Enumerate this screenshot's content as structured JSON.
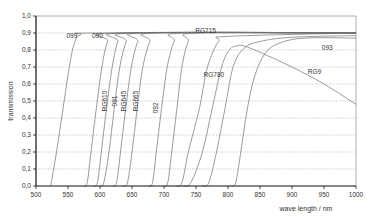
{
  "chart_data": {
    "type": "line",
    "title": "",
    "xlabel": "wave length / nm",
    "ylabel": "transmission",
    "xlim": [
      500,
      1000
    ],
    "ylim": [
      0.0,
      1.0
    ],
    "x_ticks": [
      "500",
      "550",
      "600",
      "650",
      "700",
      "750",
      "800",
      "850",
      "900",
      "950",
      "1000"
    ],
    "y_ticks": [
      "0,0",
      "0,1",
      "0,2",
      "0,3",
      "0,4",
      "0,5",
      "0,6",
      "0,7",
      "0,8",
      "0,9",
      "1,0"
    ],
    "grid": "horizontal dotted",
    "legend": "none (inline curve labels)",
    "series": [
      {
        "name": "099",
        "label_pos": [
          556,
          0.87
        ],
        "label_rot": 0,
        "points": [
          [
            523,
            0
          ],
          [
            532,
            0.2
          ],
          [
            542,
            0.45
          ],
          [
            552,
            0.7
          ],
          [
            560,
            0.84
          ],
          [
            570,
            0.89
          ],
          [
            600,
            0.9
          ],
          [
            1000,
            0.9
          ]
        ]
      },
      {
        "name": "090",
        "label_pos": [
          596,
          0.87
        ],
        "label_rot": 0,
        "points": [
          [
            575,
            0
          ],
          [
            580,
            0.02
          ],
          [
            586,
            0.2
          ],
          [
            594,
            0.45
          ],
          [
            603,
            0.7
          ],
          [
            612,
            0.85
          ],
          [
            625,
            0.9
          ],
          [
            1000,
            0.9
          ]
        ]
      },
      {
        "name": "RG610",
        "label_pos": [
          611,
          0.5
        ],
        "label_rot": -90,
        "points": [
          [
            590,
            0
          ],
          [
            596,
            0.02
          ],
          [
            602,
            0.2
          ],
          [
            610,
            0.45
          ],
          [
            619,
            0.7
          ],
          [
            628,
            0.85
          ],
          [
            640,
            0.9
          ],
          [
            1000,
            0.9
          ]
        ]
      },
      {
        "name": "091",
        "label_pos": [
          627,
          0.5
        ],
        "label_rot": -90,
        "points": [
          [
            600,
            0
          ],
          [
            606,
            0.02
          ],
          [
            614,
            0.2
          ],
          [
            622,
            0.45
          ],
          [
            631,
            0.7
          ],
          [
            641,
            0.85
          ],
          [
            653,
            0.9
          ],
          [
            1000,
            0.9
          ]
        ]
      },
      {
        "name": "RG645",
        "label_pos": [
          640,
          0.5
        ],
        "label_rot": -90,
        "points": [
          [
            620,
            0
          ],
          [
            626,
            0.02
          ],
          [
            632,
            0.2
          ],
          [
            640,
            0.45
          ],
          [
            649,
            0.7
          ],
          [
            659,
            0.85
          ],
          [
            670,
            0.9
          ],
          [
            1000,
            0.9
          ]
        ]
      },
      {
        "name": "RG665",
        "label_pos": [
          660,
          0.5
        ],
        "label_rot": -90,
        "points": [
          [
            636,
            0
          ],
          [
            643,
            0.02
          ],
          [
            650,
            0.2
          ],
          [
            658,
            0.45
          ],
          [
            667,
            0.7
          ],
          [
            678,
            0.85
          ],
          [
            690,
            0.9
          ],
          [
            1000,
            0.9
          ]
        ]
      },
      {
        "name": "092",
        "label_pos": [
          690,
          0.46
        ],
        "label_rot": -90,
        "points": [
          [
            676,
            0
          ],
          [
            682,
            0.02
          ],
          [
            688,
            0.2
          ],
          [
            696,
            0.45
          ],
          [
            705,
            0.7
          ],
          [
            716,
            0.85
          ],
          [
            730,
            0.9
          ],
          [
            1000,
            0.9
          ]
        ]
      },
      {
        "name": "RG715",
        "label_pos": [
          765,
          0.9
        ],
        "label_rot": 0,
        "points": [
          [
            700,
            0
          ],
          [
            706,
            0.02
          ],
          [
            712,
            0.2
          ],
          [
            720,
            0.45
          ],
          [
            728,
            0.7
          ],
          [
            738,
            0.85
          ],
          [
            752,
            0.9
          ],
          [
            1000,
            0.9
          ]
        ]
      },
      {
        "name": "RG780",
        "label_pos": [
          778,
          0.64
        ],
        "label_rot": 0,
        "points": [
          [
            718,
            0
          ],
          [
            728,
            0.02
          ],
          [
            738,
            0.2
          ],
          [
            755,
            0.45
          ],
          [
            768,
            0.7
          ],
          [
            785,
            0.85
          ],
          [
            800,
            0.88
          ],
          [
            1000,
            0.9
          ]
        ]
      },
      {
        "name": "RG9",
        "label_pos": [
          935,
          0.66
        ],
        "label_rot": 0,
        "points": [
          [
            730,
            0
          ],
          [
            742,
            0.02
          ],
          [
            760,
            0.2
          ],
          [
            775,
            0.45
          ],
          [
            790,
            0.7
          ],
          [
            802,
            0.8
          ],
          [
            815,
            0.825
          ],
          [
            828,
            0.82
          ],
          [
            860,
            0.77
          ],
          [
            900,
            0.7
          ],
          [
            950,
            0.6
          ],
          [
            1000,
            0.48
          ]
        ]
      },
      {
        "name": "093",
        "label_pos": [
          955,
          0.8
        ],
        "label_rot": 0,
        "points": [
          [
            805,
            0
          ],
          [
            812,
            0.02
          ],
          [
            820,
            0.2
          ],
          [
            830,
            0.45
          ],
          [
            842,
            0.65
          ],
          [
            858,
            0.78
          ],
          [
            880,
            0.84
          ],
          [
            920,
            0.87
          ],
          [
            1000,
            0.87
          ]
        ]
      },
      {
        "name": "RG830-upper",
        "label_pos": null,
        "label_rot": 0,
        "points": [
          [
            760,
            0
          ],
          [
            770,
            0.02
          ],
          [
            782,
            0.2
          ],
          [
            795,
            0.45
          ],
          [
            808,
            0.7
          ],
          [
            825,
            0.81
          ],
          [
            850,
            0.85
          ],
          [
            900,
            0.875
          ],
          [
            1000,
            0.885
          ]
        ]
      }
    ]
  }
}
